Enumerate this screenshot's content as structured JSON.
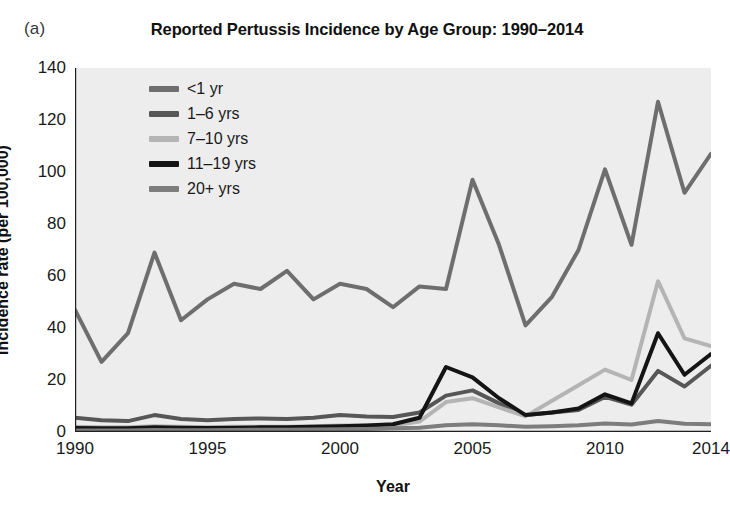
{
  "panel": {
    "label": "(a)"
  },
  "axis_titles": {
    "x": "Year",
    "y": "Incidence rate (per 100,000)"
  },
  "colors": {
    "plot_background": "#ededed",
    "axis": "#1f1f1f",
    "series_lt1": "#6e6e6e",
    "series_1_6": "#575757",
    "series_7_10": "#b4b4b4",
    "series_11_19": "#141414",
    "series_20plus": "#7d7d7d"
  },
  "legend": {
    "items": [
      {
        "label": "<1 yr",
        "color": "#6e6e6e"
      },
      {
        "label": "1–6 yrs",
        "color": "#575757"
      },
      {
        "label": "7–10 yrs",
        "color": "#b4b4b4"
      },
      {
        "label": "11–19 yrs",
        "color": "#141414"
      },
      {
        "label": "20+ yrs",
        "color": "#7d7d7d"
      }
    ]
  },
  "chart_data": {
    "type": "line",
    "title": "Reported Pertussis Incidence by Age Group: 1990–2014",
    "xlabel": "Year",
    "ylabel": "Incidence rate (per 100,000)",
    "xlim": [
      1990,
      2014
    ],
    "ylim": [
      0,
      140
    ],
    "yticks": [
      0,
      20,
      40,
      60,
      80,
      100,
      120,
      140
    ],
    "xticks": [
      1990,
      1995,
      2000,
      2005,
      2010,
      2014
    ],
    "grid": false,
    "legend_position": "top-left inside",
    "x": [
      1990,
      1991,
      1992,
      1993,
      1994,
      1995,
      1996,
      1997,
      1998,
      1999,
      2000,
      2001,
      2002,
      2003,
      2004,
      2005,
      2006,
      2007,
      2008,
      2009,
      2010,
      2011,
      2012,
      2013,
      2014
    ],
    "series": [
      {
        "name": "<1 yr",
        "color": "#6e6e6e",
        "values": [
          47,
          27,
          38,
          69,
          43,
          51,
          57,
          55,
          62,
          51,
          57,
          55,
          48,
          56,
          55,
          97,
          72,
          41,
          52,
          70,
          101,
          72,
          127,
          92,
          107
        ]
      },
      {
        "name": "1–6 yrs",
        "color": "#575757",
        "values": [
          5.5,
          4.5,
          4.2,
          6.5,
          5.0,
          4.5,
          5.0,
          5.2,
          5.0,
          5.5,
          6.5,
          6.0,
          5.8,
          7.5,
          14.0,
          16.0,
          11.0,
          6.5,
          7.5,
          8.5,
          13.5,
          10.5,
          23.5,
          17.5,
          25.5
        ]
      },
      {
        "name": "7–10 yrs",
        "color": "#b4b4b4",
        "values": [
          2.0,
          1.8,
          1.8,
          2.2,
          2.0,
          1.8,
          2.0,
          2.0,
          2.0,
          2.2,
          2.5,
          2.5,
          2.5,
          4.0,
          11.5,
          13.0,
          9.5,
          6.0,
          12.0,
          18.0,
          24.0,
          20.0,
          58.0,
          36.0,
          33.0
        ]
      },
      {
        "name": "11–19 yrs",
        "color": "#141414",
        "values": [
          1.5,
          1.4,
          1.4,
          1.8,
          1.6,
          1.5,
          1.6,
          1.8,
          1.8,
          2.0,
          2.2,
          2.5,
          3.0,
          5.5,
          25.0,
          21.0,
          13.0,
          6.5,
          7.5,
          9.0,
          14.5,
          11.0,
          38.0,
          22.0,
          30.0
        ]
      },
      {
        "name": "20+ yrs",
        "color": "#7d7d7d",
        "values": [
          0.6,
          0.6,
          0.6,
          0.8,
          0.7,
          0.7,
          0.8,
          0.9,
          0.9,
          1.0,
          1.1,
          1.2,
          1.4,
          1.6,
          2.6,
          3.0,
          2.6,
          2.0,
          2.2,
          2.6,
          3.3,
          2.9,
          4.2,
          3.2,
          3.0
        ]
      }
    ]
  }
}
